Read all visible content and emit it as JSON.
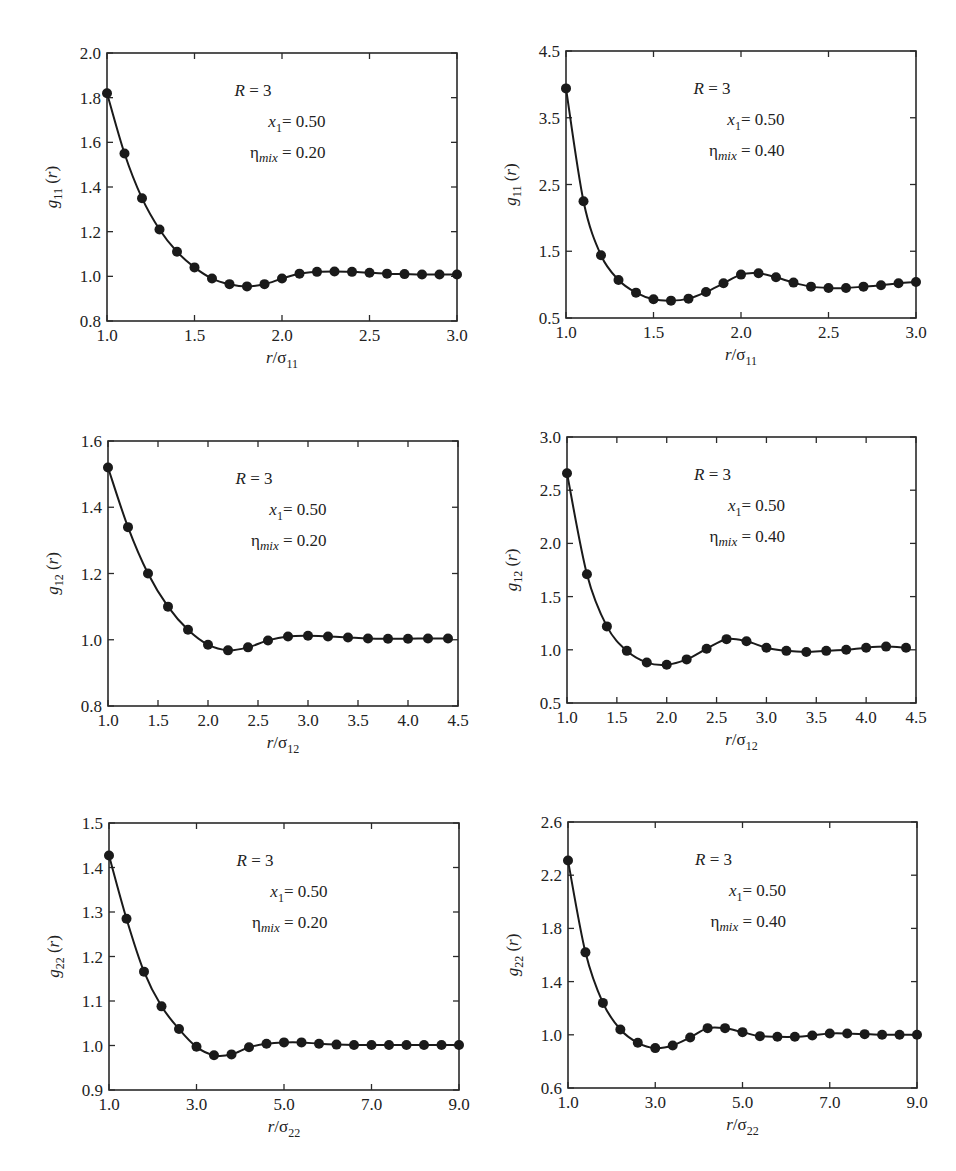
{
  "figure": {
    "annotation": {
      "R": "R = 3",
      "x1": "= 0.50"
    },
    "panels_layout": [
      {
        "box": [
          107,
          53,
          457,
          321
        ]
      },
      {
        "box": [
          566,
          51,
          916,
          318
        ]
      },
      {
        "box": [
          108,
          441,
          458,
          706
        ]
      },
      {
        "box": [
          567,
          437,
          916,
          703
        ]
      },
      {
        "box": [
          109,
          823,
          459,
          1090
        ]
      },
      {
        "box": [
          568,
          822,
          917,
          1088
        ]
      }
    ]
  },
  "chart_data": [
    {
      "type": "line",
      "title": "",
      "ylabel_base": "g",
      "ylabel_sub": "11",
      "ylabel_tail": " (r)",
      "xlabel_base": "r/σ",
      "xlabel_sub": "11",
      "annotation": [
        "R = 3",
        "x1 = 0.50",
        "ηmix = 0.20"
      ],
      "eta_value": "= 0.20",
      "xlim": [
        1.0,
        3.0
      ],
      "ylim": [
        0.8,
        2.0
      ],
      "xticks": [
        1.0,
        1.5,
        2.0,
        2.5,
        3.0
      ],
      "xtick_labels": [
        "1.0",
        "1.5",
        "2.0",
        "2.5",
        "3.0"
      ],
      "yticks": [
        0.8,
        1.0,
        1.2,
        1.4,
        1.6,
        1.8,
        2.0
      ],
      "ytick_labels": [
        "0.8",
        "1.0",
        "1.2",
        "1.4",
        "1.6",
        "1.8",
        "2.0"
      ],
      "grid": false,
      "series": [
        {
          "name": "theory (line)",
          "style": "line"
        },
        {
          "name": "simulation (markers)",
          "style": "markers"
        }
      ],
      "x": [
        1.0,
        1.1,
        1.2,
        1.3,
        1.4,
        1.5,
        1.6,
        1.7,
        1.8,
        1.9,
        2.0,
        2.1,
        2.2,
        2.3,
        2.4,
        2.5,
        2.6,
        2.7,
        2.8,
        2.9,
        3.0
      ],
      "y": [
        1.82,
        1.55,
        1.35,
        1.21,
        1.11,
        1.04,
        0.99,
        0.965,
        0.955,
        0.965,
        0.99,
        1.012,
        1.02,
        1.022,
        1.02,
        1.016,
        1.012,
        1.01,
        1.008,
        1.008,
        1.008
      ]
    },
    {
      "type": "line",
      "title": "",
      "ylabel_base": "g",
      "ylabel_sub": "11",
      "ylabel_tail": " (r)",
      "xlabel_base": "r/σ",
      "xlabel_sub": "11",
      "annotation": [
        "R = 3",
        "x1 = 0.50",
        "ηmix = 0.40"
      ],
      "eta_value": "= 0.40",
      "xlim": [
        1.0,
        3.0
      ],
      "ylim": [
        0.5,
        4.5
      ],
      "xticks": [
        1.0,
        1.5,
        2.0,
        2.5,
        3.0
      ],
      "xtick_labels": [
        "1.0",
        "1.5",
        "2.0",
        "2.5",
        "3.0"
      ],
      "yticks": [
        0.5,
        1.5,
        2.5,
        3.5,
        4.5
      ],
      "ytick_labels": [
        "0.5",
        "1.5",
        "2.5",
        "3.5",
        "4.5"
      ],
      "grid": false,
      "series": [
        {
          "name": "theory (line)",
          "style": "line"
        },
        {
          "name": "simulation (markers)",
          "style": "markers"
        }
      ],
      "x": [
        1.0,
        1.1,
        1.2,
        1.3,
        1.4,
        1.5,
        1.6,
        1.7,
        1.8,
        1.9,
        2.0,
        2.1,
        2.2,
        2.3,
        2.4,
        2.5,
        2.6,
        2.7,
        2.8,
        2.9,
        3.0
      ],
      "y": [
        3.94,
        2.25,
        1.44,
        1.07,
        0.88,
        0.78,
        0.76,
        0.79,
        0.89,
        1.02,
        1.15,
        1.17,
        1.11,
        1.03,
        0.97,
        0.95,
        0.95,
        0.97,
        0.99,
        1.02,
        1.04
      ]
    },
    {
      "type": "line",
      "title": "",
      "ylabel_base": "g",
      "ylabel_sub": "12",
      "ylabel_tail": " (r)",
      "xlabel_base": "r/σ",
      "xlabel_sub": "12",
      "annotation": [
        "R = 3",
        "x1 = 0.50",
        "ηmix = 0.20"
      ],
      "eta_value": "= 0.20",
      "xlim": [
        1.0,
        4.5
      ],
      "ylim": [
        0.8,
        1.6
      ],
      "xticks": [
        1.0,
        1.5,
        2.0,
        2.5,
        3.0,
        3.5,
        4.0,
        4.5
      ],
      "xtick_labels": [
        "1.0",
        "1.5",
        "2.0",
        "2.5",
        "3.0",
        "3.5",
        "4.0",
        "4.5"
      ],
      "yticks": [
        0.8,
        1.0,
        1.2,
        1.4,
        1.6
      ],
      "ytick_labels": [
        "0.8",
        "1.0",
        "1.2",
        "1.4",
        "1.6"
      ],
      "grid": false,
      "series": [
        {
          "name": "theory (line)",
          "style": "line"
        },
        {
          "name": "simulation (markers)",
          "style": "markers"
        }
      ],
      "x": [
        1.0,
        1.2,
        1.4,
        1.6,
        1.8,
        2.0,
        2.2,
        2.4,
        2.6,
        2.8,
        3.0,
        3.2,
        3.4,
        3.6,
        3.8,
        4.0,
        4.2,
        4.4
      ],
      "y": [
        1.52,
        1.34,
        1.2,
        1.1,
        1.03,
        0.985,
        0.968,
        0.977,
        0.998,
        1.01,
        1.012,
        1.01,
        1.007,
        1.004,
        1.003,
        1.003,
        1.004,
        1.004
      ]
    },
    {
      "type": "line",
      "title": "",
      "ylabel_base": "g",
      "ylabel_sub": "12",
      "ylabel_tail": " (r)",
      "xlabel_base": "r/σ",
      "xlabel_sub": "12",
      "annotation": [
        "R = 3",
        "x1 = 0.50",
        "ηmix = 0.40"
      ],
      "eta_value": "= 0.40",
      "xlim": [
        1.0,
        4.5
      ],
      "ylim": [
        0.5,
        3.0
      ],
      "xticks": [
        1.0,
        1.5,
        2.0,
        2.5,
        3.0,
        3.5,
        4.0,
        4.5
      ],
      "xtick_labels": [
        "1.0",
        "1.5",
        "2.0",
        "2.5",
        "3.0",
        "3.5",
        "4.0",
        "4.5"
      ],
      "yticks": [
        0.5,
        1.0,
        1.5,
        2.0,
        2.5,
        3.0
      ],
      "ytick_labels": [
        "0.5",
        "1.0",
        "1.5",
        "2.0",
        "2.5",
        "3.0"
      ],
      "grid": false,
      "series": [
        {
          "name": "theory (line)",
          "style": "line"
        },
        {
          "name": "simulation (markers)",
          "style": "markers"
        }
      ],
      "x": [
        1.0,
        1.2,
        1.4,
        1.6,
        1.8,
        2.0,
        2.2,
        2.4,
        2.6,
        2.8,
        3.0,
        3.2,
        3.4,
        3.6,
        3.8,
        4.0,
        4.2,
        4.4
      ],
      "y": [
        2.66,
        1.71,
        1.22,
        0.99,
        0.88,
        0.86,
        0.91,
        1.01,
        1.1,
        1.08,
        1.02,
        0.99,
        0.98,
        0.99,
        1.0,
        1.02,
        1.03,
        1.02
      ]
    },
    {
      "type": "line",
      "title": "",
      "ylabel_base": "g",
      "ylabel_sub": "22",
      "ylabel_tail": " (r)",
      "xlabel_base": "r/σ",
      "xlabel_sub": "22",
      "annotation": [
        "R = 3",
        "x1 = 0.50",
        "ηmix = 0.20"
      ],
      "eta_value": "= 0.20",
      "xlim": [
        1.0,
        9.0
      ],
      "ylim": [
        0.9,
        1.5
      ],
      "xticks": [
        1.0,
        3.0,
        5.0,
        7.0,
        9.0
      ],
      "xtick_labels": [
        "1.0",
        "3.0",
        "5.0",
        "7.0",
        "9.0"
      ],
      "yticks": [
        0.9,
        1.0,
        1.1,
        1.2,
        1.3,
        1.4,
        1.5
      ],
      "ytick_labels": [
        "0.9",
        "1.0",
        "1.1",
        "1.2",
        "1.3",
        "1.4",
        "1.5"
      ],
      "grid": false,
      "series": [
        {
          "name": "theory (line)",
          "style": "line"
        },
        {
          "name": "simulation (markers)",
          "style": "markers"
        }
      ],
      "x": [
        1.0,
        1.4,
        1.8,
        2.2,
        2.6,
        3.0,
        3.4,
        3.8,
        4.2,
        4.6,
        5.0,
        5.4,
        5.8,
        6.2,
        6.6,
        7.0,
        7.4,
        7.8,
        8.2,
        8.6,
        9.0
      ],
      "y": [
        1.427,
        1.285,
        1.166,
        1.088,
        1.037,
        0.997,
        0.978,
        0.98,
        0.996,
        1.004,
        1.007,
        1.007,
        1.004,
        1.002,
        1.001,
        1.001,
        1.001,
        1.001,
        1.001,
        1.001,
        1.001
      ]
    },
    {
      "type": "line",
      "title": "",
      "ylabel_base": "g",
      "ylabel_sub": "22",
      "ylabel_tail": " (r)",
      "xlabel_base": "r/σ",
      "xlabel_sub": "22",
      "annotation": [
        "R = 3",
        "x1 = 0.50",
        "ηmix = 0.40"
      ],
      "eta_value": "= 0.40",
      "xlim": [
        1.0,
        9.0
      ],
      "ylim": [
        0.6,
        2.6
      ],
      "xticks": [
        1.0,
        3.0,
        5.0,
        7.0,
        9.0
      ],
      "xtick_labels": [
        "1.0",
        "3.0",
        "5.0",
        "7.0",
        "9.0"
      ],
      "yticks": [
        0.6,
        1.0,
        1.4,
        1.8,
        2.2,
        2.6
      ],
      "ytick_labels": [
        "0.6",
        "1.0",
        "1.4",
        "1.8",
        "2.2",
        "2.6"
      ],
      "grid": false,
      "series": [
        {
          "name": "theory (line)",
          "style": "line"
        },
        {
          "name": "simulation (markers)",
          "style": "markers"
        }
      ],
      "x": [
        1.0,
        1.4,
        1.8,
        2.2,
        2.6,
        3.0,
        3.4,
        3.8,
        4.2,
        4.6,
        5.0,
        5.4,
        5.8,
        6.2,
        6.6,
        7.0,
        7.4,
        7.8,
        8.2,
        8.6,
        9.0
      ],
      "y": [
        2.31,
        1.62,
        1.24,
        1.04,
        0.94,
        0.9,
        0.92,
        0.98,
        1.05,
        1.05,
        1.02,
        0.99,
        0.985,
        0.985,
        0.995,
        1.01,
        1.01,
        1.005,
        1.0,
        1.0,
        1.0
      ]
    }
  ]
}
